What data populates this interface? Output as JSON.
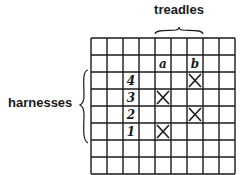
{
  "labels": {
    "treadles": "treadles",
    "harnesses": "harnesses"
  },
  "grid": {
    "columns": 9,
    "rows": 8,
    "origin": [
      91,
      38
    ],
    "cell_width": 16,
    "cell_height": 17,
    "line_color": "#1a1a1a"
  },
  "treadles": [
    {
      "label": "a",
      "column": 4
    },
    {
      "label": "b",
      "column": 6
    }
  ],
  "harnesses": [
    {
      "label": "4",
      "row": 2
    },
    {
      "label": "3",
      "row": 3
    },
    {
      "label": "2",
      "row": 4
    },
    {
      "label": "1",
      "row": 5
    }
  ],
  "header_row": 1,
  "label_column": 2,
  "tie_up": [
    {
      "treadle": "b",
      "harness": "4"
    },
    {
      "treadle": "a",
      "harness": "3"
    },
    {
      "treadle": "b",
      "harness": "2"
    },
    {
      "treadle": "a",
      "harness": "1"
    }
  ]
}
